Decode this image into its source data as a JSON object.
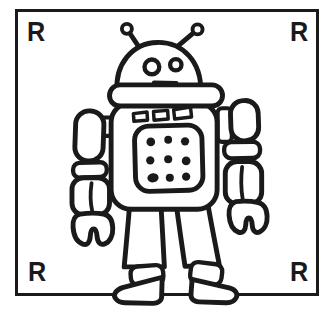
{
  "card": {
    "corner_letters": {
      "top_left": "R",
      "top_right": "R",
      "bottom_left": "R",
      "bottom_right": "R"
    },
    "illustration": {
      "name": "robot-line-drawing"
    },
    "colors": {
      "ink": "#1a1a1a",
      "paper": "#ffffff"
    }
  }
}
